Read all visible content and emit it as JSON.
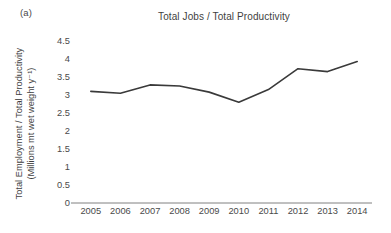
{
  "panel": {
    "label": "(a)"
  },
  "chart_data": {
    "type": "line",
    "title": "Total Jobs / Total Productivity",
    "xlabel": "",
    "ylabel": "Total Employment / Total Productivity (Millions mt wet weight y⁻¹)",
    "ylabel_line1": "Total Employment / Total Productivity",
    "ylabel_line2": "(Millions mt wet weight y⁻¹)",
    "categories": [
      "2005",
      "2006",
      "2007",
      "2008",
      "2009",
      "2010",
      "2011",
      "2012",
      "2013",
      "2014"
    ],
    "x": [
      2005,
      2006,
      2007,
      2008,
      2009,
      2010,
      2011,
      2012,
      2013,
      2014
    ],
    "values": [
      3.1,
      3.05,
      3.28,
      3.25,
      3.08,
      2.8,
      3.15,
      3.73,
      3.65,
      3.93
    ],
    "series": [
      {
        "name": "Total Jobs / Total Productivity",
        "values": [
          3.1,
          3.05,
          3.28,
          3.25,
          3.08,
          2.8,
          3.15,
          3.73,
          3.65,
          3.93
        ],
        "color": "#3a3a3a"
      }
    ],
    "ylim": [
      0,
      4.5
    ],
    "yticks": [
      0,
      0.5,
      1,
      1.5,
      2,
      2.5,
      3,
      3.5,
      4,
      4.5
    ],
    "ytick_labels": [
      "0",
      "0.5",
      "1",
      "1.5",
      "2",
      "2.5",
      "3",
      "3.5",
      "4",
      "4.5"
    ],
    "xtick_labels": [
      "2005",
      "2006",
      "2007",
      "2008",
      "2009",
      "2010",
      "2011",
      "2012",
      "2013",
      "2014"
    ],
    "grid": false,
    "legend": false,
    "legend_position": "none",
    "markers": false,
    "line_color": "#3a3a3a",
    "line_width": 1.6,
    "axis_color": "#808080",
    "text_color": "#3f3f3f",
    "background": "#ffffff"
  }
}
